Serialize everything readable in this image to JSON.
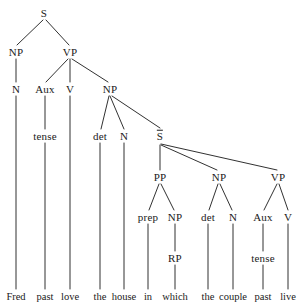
{
  "figure": {
    "type": "constituency-parse-tree",
    "sentence": "Fred past love the house in which the couple past live",
    "ink_color": "#1a1a1a",
    "background_color": "#ffffff"
  },
  "nodes": [
    {
      "id": "S",
      "label": "S",
      "x": 44,
      "y": 13,
      "overline": false
    },
    {
      "id": "NP1",
      "label": "NP",
      "x": 16,
      "y": 52,
      "overline": false
    },
    {
      "id": "VP1",
      "label": "VP",
      "x": 70,
      "y": 52,
      "overline": false
    },
    {
      "id": "N1",
      "label": "N",
      "x": 16,
      "y": 89,
      "overline": false
    },
    {
      "id": "Aux1",
      "label": "Aux",
      "x": 45,
      "y": 89,
      "overline": false
    },
    {
      "id": "V1",
      "label": "V",
      "x": 70,
      "y": 89,
      "overline": false
    },
    {
      "id": "NP2",
      "label": "NP",
      "x": 110,
      "y": 89,
      "overline": false
    },
    {
      "id": "tense1",
      "label": "tense",
      "x": 45,
      "y": 136,
      "overline": false
    },
    {
      "id": "det1",
      "label": "det",
      "x": 100,
      "y": 136,
      "overline": false
    },
    {
      "id": "N2",
      "label": "N",
      "x": 124,
      "y": 136,
      "overline": false
    },
    {
      "id": "Sbar",
      "label": "S",
      "x": 160,
      "y": 136,
      "overline": true
    },
    {
      "id": "PP",
      "label": "PP",
      "x": 160,
      "y": 177,
      "overline": false
    },
    {
      "id": "NP3",
      "label": "NP",
      "x": 219,
      "y": 177,
      "overline": false
    },
    {
      "id": "VP2",
      "label": "VP",
      "x": 278,
      "y": 177,
      "overline": false
    },
    {
      "id": "prep",
      "label": "prep",
      "x": 148,
      "y": 217,
      "overline": false
    },
    {
      "id": "NP4",
      "label": "NP",
      "x": 175,
      "y": 217,
      "overline": false
    },
    {
      "id": "det2",
      "label": "det",
      "x": 208,
      "y": 217,
      "overline": false
    },
    {
      "id": "N3",
      "label": "N",
      "x": 233,
      "y": 217,
      "overline": false
    },
    {
      "id": "Aux2",
      "label": "Aux",
      "x": 263,
      "y": 217,
      "overline": false
    },
    {
      "id": "V2",
      "label": "V",
      "x": 288,
      "y": 217,
      "overline": false
    },
    {
      "id": "RP",
      "label": "RP",
      "x": 175,
      "y": 258,
      "overline": false
    },
    {
      "id": "tense2",
      "label": "tense",
      "x": 263,
      "y": 258,
      "overline": false
    }
  ],
  "leaves": [
    {
      "id": "w1",
      "label": "Fred",
      "x": 16,
      "y": 297
    },
    {
      "id": "w2",
      "label": "past",
      "x": 45,
      "y": 297
    },
    {
      "id": "w3",
      "label": "love",
      "x": 70,
      "y": 297
    },
    {
      "id": "w4",
      "label": "the",
      "x": 100,
      "y": 297
    },
    {
      "id": "w5",
      "label": "house",
      "x": 124,
      "y": 297
    },
    {
      "id": "w6",
      "label": "in",
      "x": 148,
      "y": 297
    },
    {
      "id": "w7",
      "label": "which",
      "x": 175,
      "y": 297
    },
    {
      "id": "w8",
      "label": "the",
      "x": 208,
      "y": 297
    },
    {
      "id": "w9",
      "label": "couple",
      "x": 233,
      "y": 297
    },
    {
      "id": "w10",
      "label": "past",
      "x": 263,
      "y": 297
    },
    {
      "id": "w11",
      "label": "live",
      "x": 288,
      "y": 297
    }
  ],
  "edges": [
    {
      "from": "S",
      "to": "NP1",
      "x1": 43,
      "y1": 20,
      "x2": 17,
      "y2": 45
    },
    {
      "from": "S",
      "to": "VP1",
      "x1": 46,
      "y1": 20,
      "x2": 69,
      "y2": 45
    },
    {
      "from": "NP1",
      "to": "N1",
      "x1": 16,
      "y1": 59,
      "x2": 16,
      "y2": 82
    },
    {
      "from": "VP1",
      "to": "Aux1",
      "x1": 68,
      "y1": 59,
      "x2": 46,
      "y2": 82
    },
    {
      "from": "VP1",
      "to": "V1",
      "x1": 70,
      "y1": 59,
      "x2": 70,
      "y2": 82
    },
    {
      "from": "VP1",
      "to": "NP2",
      "x1": 72,
      "y1": 59,
      "x2": 108,
      "y2": 82
    },
    {
      "from": "N1",
      "to": "w1",
      "x1": 16,
      "y1": 96,
      "x2": 16,
      "y2": 289
    },
    {
      "from": "Aux1",
      "to": "tense1",
      "x1": 45,
      "y1": 96,
      "x2": 45,
      "y2": 129
    },
    {
      "from": "V1",
      "to": "w3",
      "x1": 70,
      "y1": 96,
      "x2": 70,
      "y2": 289
    },
    {
      "from": "NP2",
      "to": "det1",
      "x1": 109,
      "y1": 96,
      "x2": 101,
      "y2": 129
    },
    {
      "from": "NP2",
      "to": "N2",
      "x1": 110,
      "y1": 96,
      "x2": 124,
      "y2": 129
    },
    {
      "from": "NP2",
      "to": "Sbar",
      "x1": 112,
      "y1": 96,
      "x2": 160,
      "y2": 128
    },
    {
      "from": "tense1",
      "to": "w2",
      "x1": 45,
      "y1": 143,
      "x2": 45,
      "y2": 289
    },
    {
      "from": "det1",
      "to": "w4",
      "x1": 100,
      "y1": 143,
      "x2": 100,
      "y2": 289
    },
    {
      "from": "N2",
      "to": "w5",
      "x1": 124,
      "y1": 143,
      "x2": 124,
      "y2": 289
    },
    {
      "from": "Sbar",
      "to": "PP",
      "x1": 160,
      "y1": 145,
      "x2": 160,
      "y2": 170
    },
    {
      "from": "Sbar",
      "to": "NP3",
      "x1": 161,
      "y1": 145,
      "x2": 217,
      "y2": 170
    },
    {
      "from": "Sbar",
      "to": "VP2",
      "x1": 161,
      "y1": 144,
      "x2": 277,
      "y2": 170
    },
    {
      "from": "PP",
      "to": "prep",
      "x1": 159,
      "y1": 184,
      "x2": 149,
      "y2": 210
    },
    {
      "from": "PP",
      "to": "NP4",
      "x1": 161,
      "y1": 184,
      "x2": 174,
      "y2": 210
    },
    {
      "from": "NP3",
      "to": "det2",
      "x1": 218,
      "y1": 184,
      "x2": 209,
      "y2": 210
    },
    {
      "from": "NP3",
      "to": "N3",
      "x1": 220,
      "y1": 184,
      "x2": 232,
      "y2": 210
    },
    {
      "from": "VP2",
      "to": "Aux2",
      "x1": 277,
      "y1": 184,
      "x2": 264,
      "y2": 210
    },
    {
      "from": "VP2",
      "to": "V2",
      "x1": 279,
      "y1": 184,
      "x2": 288,
      "y2": 210
    },
    {
      "from": "prep",
      "to": "w6",
      "x1": 148,
      "y1": 224,
      "x2": 148,
      "y2": 289
    },
    {
      "from": "NP4",
      "to": "RP",
      "x1": 175,
      "y1": 224,
      "x2": 175,
      "y2": 251
    },
    {
      "from": "det2",
      "to": "w8",
      "x1": 208,
      "y1": 224,
      "x2": 208,
      "y2": 289
    },
    {
      "from": "N3",
      "to": "w9",
      "x1": 233,
      "y1": 224,
      "x2": 233,
      "y2": 289
    },
    {
      "from": "Aux2",
      "to": "tense2",
      "x1": 263,
      "y1": 224,
      "x2": 263,
      "y2": 251
    },
    {
      "from": "V2",
      "to": "w11",
      "x1": 288,
      "y1": 224,
      "x2": 288,
      "y2": 289
    },
    {
      "from": "RP",
      "to": "w7",
      "x1": 175,
      "y1": 265,
      "x2": 175,
      "y2": 289
    },
    {
      "from": "tense2",
      "to": "w10",
      "x1": 263,
      "y1": 265,
      "x2": 263,
      "y2": 289
    }
  ]
}
